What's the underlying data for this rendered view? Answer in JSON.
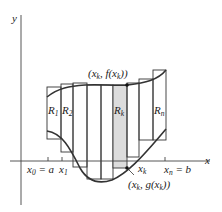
{
  "diagram": {
    "type": "riemann-area-between-curves",
    "axis_labels": {
      "x": "x",
      "y": "y"
    },
    "tick_labels": {
      "x0": {
        "main": "x",
        "sub": "0",
        "suffix": " = a"
      },
      "x1": {
        "main": "x",
        "sub": "1"
      },
      "xk": {
        "main": "x",
        "sub": "k"
      },
      "xn": {
        "main": "x",
        "sub": "n",
        "suffix": " = b"
      }
    },
    "point_labels": {
      "top": {
        "text": "(x",
        "sub": "k",
        "mid": ", f(x",
        "sub2": "k",
        "end": "))"
      },
      "bottom": {
        "text": "(x",
        "sub": "k",
        "mid": ", g(x",
        "sub2": "k",
        "end": "))"
      }
    },
    "rectangle_labels": [
      {
        "main": "R",
        "sub": "1"
      },
      {
        "main": "R",
        "sub": "2"
      },
      {
        "main": "R",
        "sub": "k"
      },
      {
        "main": "R",
        "sub": "n"
      }
    ],
    "rectangles": [
      {
        "x": 47,
        "w": 14,
        "top": 87,
        "bottom": 139
      },
      {
        "x": 61,
        "w": 12,
        "top": 84,
        "bottom": 152
      },
      {
        "x": 73,
        "w": 14,
        "top": 83,
        "bottom": 167
      },
      {
        "x": 87,
        "w": 14,
        "top": 85,
        "bottom": 179
      },
      {
        "x": 101,
        "w": 12,
        "top": 85,
        "bottom": 179
      },
      {
        "x": 113,
        "w": 14,
        "top": 85,
        "bottom": 168,
        "highlighted": true
      },
      {
        "x": 127,
        "w": 12,
        "top": 85,
        "bottom": 168
      },
      {
        "x": 139,
        "w": 14,
        "top": 83,
        "bottom": 157
      },
      {
        "x": 153,
        "w": 13,
        "top": 70,
        "bottom": 140
      }
    ],
    "colors": {
      "highlight": "#dcdcdc",
      "stroke": "#333333",
      "curve": "#333333"
    }
  }
}
